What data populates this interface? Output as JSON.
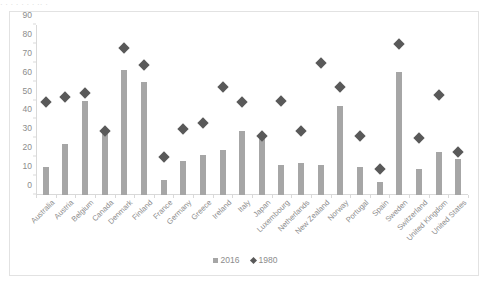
{
  "top_strip": {
    "text": "·   ·      ·         ·      ·   ·            ·      ··    ·"
  },
  "legend": {
    "position": "bottom-center",
    "items": [
      {
        "label": "2016",
        "marker": "square-swatch",
        "color": "#a6a6a6"
      },
      {
        "label": "1980",
        "marker": "diamond-swatch",
        "color": "#595959"
      }
    ]
  },
  "axis": {
    "yticks": [
      0,
      10,
      20,
      30,
      40,
      50,
      60,
      70,
      80,
      90
    ],
    "ylim": [
      0,
      90
    ]
  },
  "colors": {
    "bar_2016": "#a6a6a6",
    "marker_1980": "#595959",
    "axis_line": "#d9d9d9",
    "tick_text": "#8c8c8c",
    "frame_border": "#e2e2e2",
    "background": "#ffffff"
  },
  "chart_data": {
    "type": "bar",
    "title": "",
    "xlabel": "",
    "ylabel": "",
    "ylim": [
      0,
      90
    ],
    "grid": false,
    "legend_position": "bottom-center",
    "categories": [
      "Australia",
      "Austria",
      "Belgium",
      "Canada",
      "Denmark",
      "Finland",
      "France",
      "Germany",
      "Greece",
      "Ireland",
      "Italy",
      "Japan",
      "Luxembourg",
      "Netherlands",
      "New Zealand",
      "Norway",
      "Portugal",
      "Spain",
      "Sweden",
      "Switzerland",
      "United Kingdom",
      "United States"
    ],
    "series": [
      {
        "name": "2016",
        "type": "bar",
        "color": "#a6a6a6",
        "values": [
          15,
          27,
          50,
          33,
          66,
          60,
          8,
          18,
          21,
          24,
          34,
          31,
          16,
          17,
          16,
          47,
          15,
          7,
          65,
          14,
          23,
          19
        ]
      },
      {
        "name": "1980",
        "type": "scatter",
        "marker": "diamond",
        "color": "#595959",
        "values": [
          49,
          52,
          54,
          34,
          78,
          69,
          20,
          35,
          38,
          57,
          49,
          31,
          50,
          34,
          70,
          57,
          31,
          14,
          80,
          30,
          53,
          23
        ]
      }
    ]
  }
}
